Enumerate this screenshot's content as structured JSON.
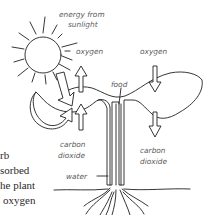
{
  "diagram": {
    "labels": {
      "energy_line1": "energy from",
      "energy_line2": "sunlight",
      "oxygen_left": "oxygen",
      "oxygen_right": "oxygen",
      "food": "food",
      "co2_left_line1": "carbon",
      "co2_left_line2": "dioxide",
      "co2_right_line1": "carbon",
      "co2_right_line2": "dioxide",
      "water": "water"
    },
    "side_text": {
      "line1": "rb",
      "line2": "sorbed",
      "line3": "he plant",
      "line4": "oxygen"
    },
    "icons": [
      "sun-icon",
      "up-arrow-icon",
      "down-arrow-icon",
      "curved-arrow-icon"
    ],
    "colors": {
      "ink": "#1f1f1f",
      "label": "#5a5a5a",
      "background": "#ffffff"
    }
  }
}
